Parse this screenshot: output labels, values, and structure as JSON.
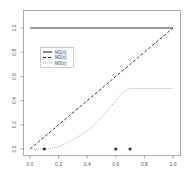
{
  "chart_data": {
    "type": "line",
    "title": "",
    "xlabel": "",
    "ylabel": "",
    "xlim": [
      0.0,
      1.0
    ],
    "ylim": [
      0.0,
      1.0
    ],
    "grid": false,
    "legend_position": "upper-left (inset)",
    "x_ticks": [
      "0.0",
      "0.2",
      "0.4",
      "0.6",
      "0.8",
      "1.0"
    ],
    "y_ticks": [
      "0.0",
      "0.2",
      "0.4",
      "0.6",
      "0.8",
      "1.0"
    ],
    "series": [
      {
        "name": "M1(x)",
        "style": "solid",
        "x": [
          0.0,
          1.0
        ],
        "y": [
          1.0,
          1.0
        ]
      },
      {
        "name": "M2(x)",
        "style": "dashed",
        "x": [
          0.0,
          1.0
        ],
        "y": [
          0.0,
          1.0
        ]
      },
      {
        "name": "M3(x)",
        "style": "dotted",
        "x": [
          0.0,
          0.1,
          0.15,
          0.2,
          0.25,
          0.3,
          0.35,
          0.4,
          0.45,
          0.5,
          0.55,
          0.6,
          0.65,
          0.7,
          0.8,
          0.9,
          1.0
        ],
        "y": [
          0.0,
          0.0,
          0.005,
          0.02,
          0.045,
          0.075,
          0.11,
          0.15,
          0.2,
          0.26,
          0.33,
          0.4,
          0.47,
          0.5,
          0.5,
          0.5,
          0.5
        ]
      }
    ],
    "points": {
      "name": "sample points",
      "x": [
        0.1,
        0.6,
        0.7
      ],
      "y": [
        0.0,
        0.0,
        0.0
      ]
    }
  },
  "legend": {
    "items": [
      {
        "label": "M1(x)",
        "style": "solid"
      },
      {
        "label": "M2(x)",
        "style": "dashed"
      },
      {
        "label": "M3(x)",
        "style": "dotted"
      }
    ]
  },
  "colors": {
    "m1": "#333333",
    "m2": "#333333",
    "m3": "#888888",
    "points": "#333333",
    "axis": "#666666"
  }
}
